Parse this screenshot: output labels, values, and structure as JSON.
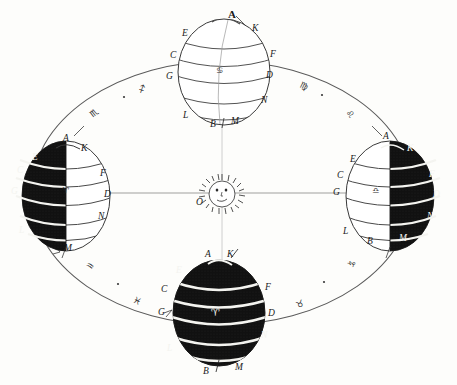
{
  "figure": {
    "background_color": "#fdfdfb",
    "ink_color": "#1a1a1a",
    "shadow_color": "#111111",
    "band_highlight_color": "#f4f4f0"
  },
  "sun": {
    "name": "Sun",
    "center_label": "O",
    "face": {
      "eye_left": "eye",
      "eye_right": "eye",
      "nose": "nose",
      "mouth": "mouth"
    },
    "ray_count": 34,
    "radius_px": 15,
    "center_x": 222,
    "center_y": 193
  },
  "orbit": {
    "name": "ecliptic-ellipse",
    "center_x": 222,
    "center_y": 193,
    "radius_x": 191,
    "radius_y": 132,
    "stroke_color": "#4a4a4a"
  },
  "axis_line": {
    "name": "major-axis",
    "from_x": 28,
    "to_x": 420,
    "y": 193
  },
  "globes": [
    {
      "id": "globe-top",
      "position": "top",
      "season_marker": "summer-solstice-position",
      "center_x": 224,
      "center_y": 72,
      "radius_x": 46,
      "radius_y": 53,
      "lit_side": "all",
      "shaded_fraction": 0.0,
      "equator_symbol": "♋",
      "labels": [
        {
          "text": "A",
          "x": 228,
          "y": 12,
          "size": "lg"
        },
        {
          "text": "K",
          "x": 252,
          "y": 26,
          "size": "md"
        },
        {
          "text": "E",
          "x": 184,
          "y": 31,
          "size": "md"
        },
        {
          "text": "C",
          "x": 172,
          "y": 53,
          "size": "md"
        },
        {
          "text": "F",
          "x": 270,
          "y": 52,
          "size": "md"
        },
        {
          "text": "G",
          "x": 169,
          "y": 73,
          "size": "md"
        },
        {
          "text": "D",
          "x": 267,
          "y": 72,
          "size": "md"
        },
        {
          "text": "N",
          "x": 262,
          "y": 97,
          "size": "md"
        },
        {
          "text": "L",
          "x": 184,
          "y": 112,
          "size": "md"
        },
        {
          "text": "B",
          "x": 211,
          "y": 122,
          "size": "md"
        },
        {
          "text": "M",
          "x": 231,
          "y": 118,
          "size": "md"
        }
      ]
    },
    {
      "id": "globe-left",
      "position": "left",
      "season_marker": "equinox-position-left",
      "center_x": 66,
      "center_y": 196,
      "radius_x": 44,
      "radius_y": 55,
      "lit_side": "right",
      "shaded_fraction": 0.5,
      "equator_symbol": "♈",
      "labels": [
        {
          "text": "A",
          "x": 65,
          "y": 136,
          "size": "md"
        },
        {
          "text": "K",
          "x": 82,
          "y": 146,
          "size": "md"
        },
        {
          "text": "E",
          "x": 33,
          "y": 155,
          "size": "md",
          "white": true
        },
        {
          "text": "C",
          "x": 18,
          "y": 168,
          "size": "md",
          "white": true
        },
        {
          "text": "F",
          "x": 100,
          "y": 171,
          "size": "md"
        },
        {
          "text": "G",
          "x": 12,
          "y": 189,
          "size": "md",
          "white": true
        },
        {
          "text": "D",
          "x": 104,
          "y": 192,
          "size": "md"
        },
        {
          "text": "N",
          "x": 99,
          "y": 214,
          "size": "md"
        },
        {
          "text": "L",
          "x": 20,
          "y": 228,
          "size": "md",
          "white": true
        },
        {
          "text": "M",
          "x": 66,
          "y": 246,
          "size": "md"
        }
      ]
    },
    {
      "id": "globe-right",
      "position": "right",
      "season_marker": "equinox-position-right",
      "center_x": 390,
      "center_y": 196,
      "radius_x": 44,
      "radius_y": 55,
      "lit_side": "left",
      "shaded_fraction": 0.5,
      "equator_symbol": "♎",
      "labels": [
        {
          "text": "A",
          "x": 384,
          "y": 134,
          "size": "md"
        },
        {
          "text": "K",
          "x": 408,
          "y": 146,
          "size": "md",
          "white": true
        },
        {
          "text": "E",
          "x": 351,
          "y": 157,
          "size": "md"
        },
        {
          "text": "C",
          "x": 338,
          "y": 173,
          "size": "md"
        },
        {
          "text": "F",
          "x": 430,
          "y": 172,
          "size": "md",
          "white": true
        },
        {
          "text": "G",
          "x": 334,
          "y": 190,
          "size": "md"
        },
        {
          "text": "D",
          "x": 434,
          "y": 192,
          "size": "md",
          "white": true
        },
        {
          "text": "N",
          "x": 428,
          "y": 214,
          "size": "md",
          "white": true
        },
        {
          "text": "L",
          "x": 344,
          "y": 229,
          "size": "md"
        },
        {
          "text": "B",
          "x": 368,
          "y": 239,
          "size": "md"
        },
        {
          "text": "M",
          "x": 400,
          "y": 236,
          "size": "md",
          "white": true
        }
      ]
    },
    {
      "id": "globe-bottom",
      "position": "bottom",
      "season_marker": "winter-solstice-position",
      "center_x": 219,
      "center_y": 313,
      "radius_x": 46,
      "radius_y": 53,
      "lit_side": "none",
      "shaded_fraction": 1.0,
      "equator_symbol": "♈",
      "labels": [
        {
          "text": "A",
          "x": 206,
          "y": 252,
          "size": "md"
        },
        {
          "text": "K",
          "x": 228,
          "y": 252,
          "size": "md"
        },
        {
          "text": "E",
          "x": 177,
          "y": 268,
          "size": "md",
          "white": true
        },
        {
          "text": "C",
          "x": 163,
          "y": 287,
          "size": "md"
        },
        {
          "text": "F",
          "x": 265,
          "y": 285,
          "size": "md"
        },
        {
          "text": "G",
          "x": 160,
          "y": 310,
          "size": "md"
        },
        {
          "text": "D",
          "x": 268,
          "y": 311,
          "size": "md"
        },
        {
          "text": "N",
          "x": 262,
          "y": 333,
          "size": "md",
          "white": true
        },
        {
          "text": "L",
          "x": 168,
          "y": 346,
          "size": "md",
          "white": true
        },
        {
          "text": "B",
          "x": 204,
          "y": 369,
          "size": "md"
        },
        {
          "text": "M",
          "x": 236,
          "y": 365,
          "size": "md"
        }
      ]
    }
  ],
  "zodiac_marks": [
    {
      "symbol": "♏",
      "name": "scorpio",
      "x": 92,
      "y": 112
    },
    {
      "symbol": "♐",
      "name": "sagittarius",
      "x": 140,
      "y": 88
    },
    {
      "symbol": "♍",
      "name": "virgo",
      "x": 302,
      "y": 85
    },
    {
      "symbol": "♌",
      "name": "leo",
      "x": 348,
      "y": 113
    },
    {
      "symbol": "♒",
      "name": "aquarius",
      "x": 88,
      "y": 265
    },
    {
      "symbol": "♓",
      "name": "pisces",
      "x": 135,
      "y": 300
    },
    {
      "symbol": "♑",
      "name": "capricorn",
      "x": 350,
      "y": 263
    },
    {
      "symbol": "♉",
      "name": "taurus",
      "x": 298,
      "y": 303
    }
  ],
  "orbit_ticks": [
    {
      "x": 124,
      "y": 96
    },
    {
      "x": 320,
      "y": 94
    },
    {
      "x": 119,
      "y": 283
    },
    {
      "x": 322,
      "y": 281
    }
  ]
}
